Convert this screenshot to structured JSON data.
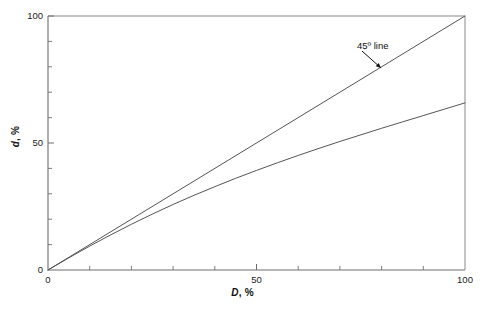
{
  "chart_data": {
    "type": "line",
    "title": "",
    "subtitle": "",
    "xlabel_main": "D",
    "xlabel_unit": ", %",
    "ylabel_main": "d",
    "ylabel_unit": ", %",
    "xlim": [
      0,
      100
    ],
    "ylim": [
      0,
      100
    ],
    "grid": false,
    "legend_position": "none",
    "x_ticks_major": [
      0,
      50,
      100
    ],
    "x_tick_labels": [
      "0",
      "50",
      "100"
    ],
    "y_ticks_major": [
      0,
      50,
      100
    ],
    "y_tick_labels": [
      "0",
      "50",
      "100"
    ],
    "x_ticks_minor": [
      10,
      20,
      30,
      40,
      60,
      70,
      80,
      90
    ],
    "y_ticks_minor": [
      10,
      20,
      30,
      40,
      60,
      70,
      80,
      90
    ],
    "series": [
      {
        "name": "45 degree line",
        "style": "solid",
        "color": "#555555",
        "x": [
          0,
          100
        ],
        "values": [
          0,
          100
        ]
      },
      {
        "name": "d versus D curve",
        "style": "solid",
        "color": "#555555",
        "x": [
          0,
          5,
          10,
          15,
          20,
          25,
          30,
          35,
          40,
          45,
          50,
          55,
          60,
          65,
          70,
          75,
          80,
          85,
          90,
          95,
          100
        ],
        "values": [
          0,
          4.8,
          9.4,
          13.8,
          18.0,
          22.0,
          25.8,
          29.4,
          32.8,
          36.1,
          39.2,
          42.2,
          45.1,
          47.9,
          50.6,
          53.2,
          55.8,
          58.3,
          60.8,
          63.3,
          65.8
        ]
      }
    ],
    "annotations": [
      {
        "text": "45º line",
        "x_px": 357,
        "y_px": 40,
        "leader_from": [
          362,
          51
        ],
        "leader_to": [
          381,
          68
        ]
      }
    ],
    "colors": {
      "axis": "#6e6e6e",
      "curve": "#555555",
      "text": "#1a1a1a",
      "background": "#ffffff"
    }
  }
}
